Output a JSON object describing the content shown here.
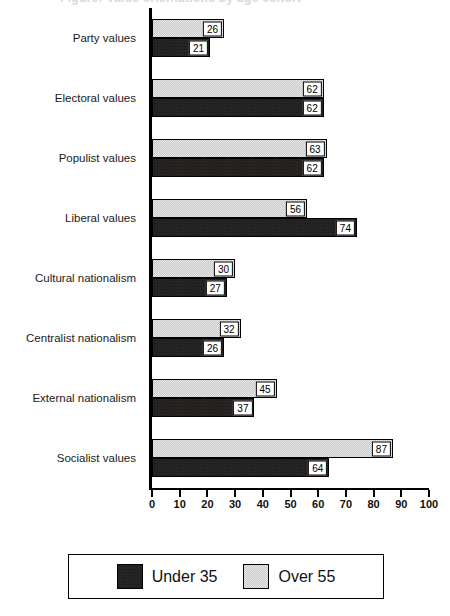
{
  "title_clipped": "Figure: Value orientations by age cohort",
  "chart_data": {
    "type": "bar",
    "orientation": "horizontal",
    "title": "",
    "xlabel": "",
    "ylabel": "",
    "xlim": [
      0,
      100
    ],
    "xticks": [
      0,
      10,
      20,
      30,
      40,
      50,
      60,
      70,
      80,
      90,
      100
    ],
    "grid": false,
    "legend_position": "bottom",
    "categories": [
      "Party values",
      "Electoral values",
      "Populist values",
      "Liberal values",
      "Cultural nationalism",
      "Centralist nationalism",
      "External nationalism",
      "Socialist values"
    ],
    "series": [
      {
        "name": "Under 35",
        "color": "#221f1f",
        "values": [
          21,
          62,
          62,
          74,
          27,
          26,
          37,
          64
        ]
      },
      {
        "name": "Over 55",
        "color": "#c9c9c9",
        "values": [
          26,
          62,
          63,
          56,
          30,
          32,
          45,
          87
        ]
      }
    ]
  },
  "legend": {
    "entries": [
      {
        "label": "Under 35",
        "swatch": "dark-swatch-icon"
      },
      {
        "label": "Over 55",
        "swatch": "light-swatch-icon"
      }
    ]
  }
}
